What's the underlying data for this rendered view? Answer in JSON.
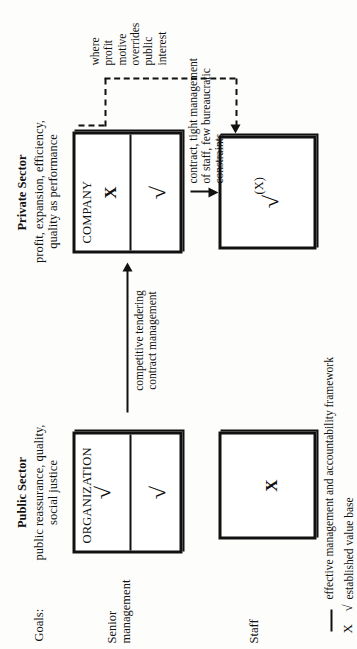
{
  "diagram": {
    "title_row_label": "Goals:",
    "columns": [
      {
        "heading": "Public Sector",
        "goals": "public reassurance, quality,\nsocial justice"
      },
      {
        "heading": "Private Sector",
        "goals": "profit, expansion, efficiency,\nquality as performance"
      }
    ],
    "row_labels": [
      "Senior\nmanagement",
      "Staff"
    ],
    "boxes": [
      {
        "id": "organization",
        "label": "ORGANIZATION",
        "top_mark": "√",
        "bottom_mark": "√"
      },
      {
        "id": "company",
        "label": "COMPANY",
        "top_mark": "X",
        "bottom_mark": "√"
      },
      {
        "id": "public-staff",
        "label": "",
        "mark": "X"
      },
      {
        "id": "private-staff",
        "label": "",
        "mark": "√",
        "mark_secondary": "(X)"
      }
    ],
    "arrows": [
      {
        "id": "tendering",
        "label": "competitive tendering\ncontract management",
        "style": "solid"
      },
      {
        "id": "contract",
        "label": "contract, tight management\nof staff, few bureaucratic\nconstraints",
        "style": "solid"
      },
      {
        "id": "profit-motive",
        "label": "where\nprofit\nmotive\noverrides\npublic\ninterest",
        "style": "dotted"
      }
    ],
    "legend": [
      {
        "symbol": "—",
        "text": "effective management and accountability framework"
      },
      {
        "symbol": "X  √",
        "text": "established value base"
      }
    ]
  }
}
